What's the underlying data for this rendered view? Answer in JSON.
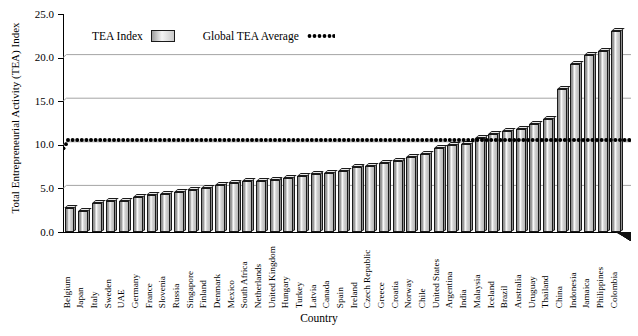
{
  "chart_data": {
    "type": "bar",
    "title": "",
    "xlabel": "Country",
    "ylabel": "Total Entrepreneurial Activity (TEA) Index",
    "ylim": [
      0.0,
      25.0
    ],
    "yticks": [
      "0.0",
      "5.0",
      "10.0",
      "15.0",
      "20.0",
      "25.0"
    ],
    "ytick_values": [
      0.0,
      5.0,
      10.0,
      15.0,
      20.0,
      25.0
    ],
    "grid": true,
    "legend_position": "top-left-inside",
    "legend": [
      {
        "label": "TEA Index",
        "marker": "bar-swatch"
      },
      {
        "label": "Global TEA Average",
        "marker": "dotted-line"
      }
    ],
    "reference_line": {
      "label": "Global TEA Average",
      "value": 10.2
    },
    "categories": [
      "Belgium",
      "Japan",
      "Italy",
      "Sweden",
      "UAE",
      "Germany",
      "France",
      "Slovenia",
      "Russia",
      "Singapore",
      "Finland",
      "Denmark",
      "Mexico",
      "South Africa",
      "Netherlands",
      "United Kingdom",
      "Hungary",
      "Turkey",
      "Latvia",
      "Canada",
      "Spain",
      "Ireland",
      "Czech Republic",
      "Greece",
      "Croatia",
      "Norway",
      "Chile",
      "United States",
      "Argentina",
      "India",
      "Malaysia",
      "Iceland",
      "Brazil",
      "Australia",
      "Uruguay",
      "Thailand",
      "China",
      "Indonesia",
      "Jamaica",
      "Philippines",
      "Colombia"
    ],
    "values": [
      2.7,
      2.4,
      3.3,
      3.5,
      3.6,
      4.0,
      4.2,
      4.4,
      4.6,
      4.8,
      5.0,
      5.4,
      5.6,
      5.8,
      5.9,
      6.0,
      6.2,
      6.4,
      6.6,
      6.8,
      7.0,
      7.4,
      7.6,
      7.9,
      8.2,
      8.6,
      9.0,
      9.6,
      10.0,
      10.1,
      10.8,
      11.2,
      11.6,
      11.8,
      12.4,
      13.0,
      16.4,
      19.3,
      20.3,
      20.8,
      23.0
    ],
    "series": [
      {
        "name": "TEA Index",
        "values": [
          2.7,
          2.4,
          3.3,
          3.5,
          3.6,
          4.0,
          4.2,
          4.4,
          4.6,
          4.8,
          5.0,
          5.4,
          5.6,
          5.8,
          5.9,
          6.0,
          6.2,
          6.4,
          6.6,
          6.8,
          7.0,
          7.4,
          7.6,
          7.9,
          8.2,
          8.6,
          9.0,
          9.6,
          10.0,
          10.1,
          10.8,
          11.2,
          11.6,
          11.8,
          12.4,
          13.0,
          16.4,
          19.3,
          20.3,
          20.8,
          23.0
        ]
      },
      {
        "name": "Global TEA Average",
        "values": [
          9.6,
          10.2,
          10.2,
          10.2,
          10.2,
          10.2,
          10.2,
          10.2,
          10.2,
          10.2,
          10.2,
          10.2,
          10.2,
          10.2,
          10.2,
          10.2,
          10.2,
          10.2,
          10.2,
          10.2,
          10.2,
          10.2,
          10.2,
          10.2,
          10.2,
          10.2,
          10.2,
          10.2,
          10.2,
          10.2,
          10.2,
          10.2,
          10.2,
          10.2,
          10.2,
          10.2,
          10.2,
          10.2,
          10.2,
          10.2,
          10.2
        ]
      }
    ]
  },
  "axes": {
    "y_title": "Total Entrepreneurial Activity (TEA) Index",
    "x_title": "Country"
  },
  "colors": {
    "bar_face": "#c9c9c9",
    "bar_edge": "#1a1a1a",
    "grid": "#9a9a9a",
    "axis": "#000000",
    "average_line": "#000000"
  }
}
